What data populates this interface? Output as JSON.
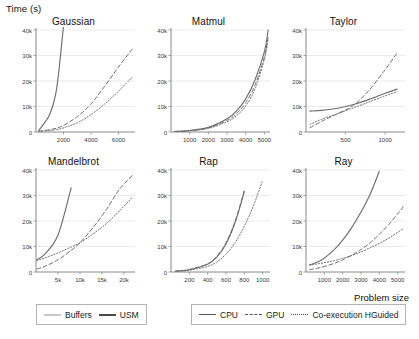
{
  "figure": {
    "ylabel": "Time (s)",
    "xlabel": "Problem size"
  },
  "legend_memory": {
    "items": [
      {
        "label": "Buffers",
        "style": "solid-light",
        "color": "#c9c9c9"
      },
      {
        "label": "USM",
        "style": "solid-dark",
        "color": "#4a4a4a"
      }
    ]
  },
  "legend_device": {
    "items": [
      {
        "label": "CPU",
        "style": "solid",
        "color": "#555555"
      },
      {
        "label": "GPU",
        "style": "dashed",
        "color": "#555555"
      },
      {
        "label": "Co-execution HGuided",
        "style": "dotted",
        "color": "#555555"
      }
    ]
  },
  "chart_data": [
    {
      "type": "line",
      "title": "Gaussian",
      "xlabel": "",
      "ylabel": "Time (s)",
      "xlim": [
        0,
        7200
      ],
      "ylim": [
        0,
        40000
      ],
      "xticks": [
        2000,
        4000,
        6000
      ],
      "xticklabels": [
        "2000",
        "4000",
        "6000"
      ],
      "yticks": [
        0,
        10000,
        20000,
        30000,
        40000
      ],
      "yticklabels": [
        "0",
        "10k",
        "20k",
        "30k",
        "40k"
      ],
      "grid": true,
      "x": [
        200,
        1000,
        1500,
        2000,
        3000,
        4000,
        5000,
        6000,
        7000
      ],
      "series": [
        {
          "name": "CPU",
          "style": "solid",
          "values": [
            600,
            7000,
            17000,
            41500,
            null,
            null,
            null,
            null,
            null
          ]
        },
        {
          "name": "GPU",
          "style": "dashed",
          "values": [
            300,
            900,
            1500,
            2600,
            6000,
            11000,
            18000,
            25500,
            32500
          ]
        },
        {
          "name": "Co-execution HGuided",
          "style": "dotted",
          "values": [
            250,
            600,
            1000,
            1600,
            3600,
            6800,
            11000,
            16000,
            21500
          ]
        }
      ]
    },
    {
      "type": "line",
      "title": "Matmul",
      "xlabel": "",
      "ylabel": "Time (s)",
      "xlim": [
        0,
        5300
      ],
      "ylim": [
        0,
        40000
      ],
      "xticks": [
        1000,
        2000,
        3000,
        4000,
        5000
      ],
      "xticklabels": [
        "1000",
        "2000",
        "3000",
        "4000",
        "5000"
      ],
      "yticks": [
        0,
        10000,
        20000,
        30000,
        40000
      ],
      "yticklabels": [
        "0",
        "10k",
        "20k",
        "30k",
        "40k"
      ],
      "grid": true,
      "x": [
        200,
        1000,
        2000,
        3000,
        3500,
        4000,
        4500,
        5000,
        5200
      ],
      "series": [
        {
          "name": "CPU",
          "style": "solid",
          "values": [
            200,
            600,
            1800,
            5200,
            8200,
            13000,
            20500,
            31500,
            40000
          ]
        },
        {
          "name": "GPU",
          "style": "dashed",
          "values": [
            200,
            550,
            1600,
            4600,
            7200,
            11500,
            18500,
            29500,
            37500
          ]
        },
        {
          "name": "Co-execution HGuided",
          "style": "dotted",
          "values": [
            180,
            500,
            1400,
            4000,
            6300,
            10200,
            17000,
            28500,
            36500
          ]
        }
      ]
    },
    {
      "type": "line",
      "title": "Taylor",
      "xlabel": "",
      "ylabel": "Time (s)",
      "xlim": [
        0,
        1250
      ],
      "ylim": [
        0,
        40000
      ],
      "xticks": [
        500,
        1000
      ],
      "xticklabels": [
        "500",
        "1000"
      ],
      "yticks": [
        0,
        10000,
        20000,
        30000,
        40000
      ],
      "yticklabels": [
        "0",
        "10k",
        "20k",
        "30k",
        "40k"
      ],
      "grid": true,
      "x": [
        50,
        200,
        400,
        600,
        800,
        1000,
        1150
      ],
      "series": [
        {
          "name": "CPU",
          "style": "solid",
          "values": [
            8200,
            8500,
            9300,
            10800,
            12800,
            15200,
            16800
          ]
        },
        {
          "name": "GPU",
          "style": "dashed",
          "values": [
            1700,
            4200,
            7200,
            10500,
            16500,
            24500,
            31000
          ]
        },
        {
          "name": "Co-execution HGuided",
          "style": "dotted",
          "values": [
            3000,
            5000,
            7200,
            9500,
            11800,
            14200,
            15800
          ]
        }
      ]
    },
    {
      "type": "line",
      "title": "Mandelbrot",
      "xlabel": "",
      "ylabel": "Time (s)",
      "xlim": [
        0,
        22500
      ],
      "ylim": [
        0,
        40000
      ],
      "xticks": [
        5000,
        10000,
        15000,
        20000
      ],
      "xticklabels": [
        "5k",
        "10k",
        "15k",
        "20k"
      ],
      "yticks": [
        0,
        10000,
        20000,
        30000,
        40000
      ],
      "yticklabels": [
        "0",
        "10k",
        "20k",
        "30k",
        "40k"
      ],
      "grid": true,
      "x": [
        200,
        2000,
        5000,
        8000,
        10000,
        13000,
        16000,
        19000,
        22000
      ],
      "series": [
        {
          "name": "CPU",
          "style": "solid",
          "values": [
            4800,
            7000,
            14500,
            33000,
            null,
            null,
            null,
            null,
            null
          ]
        },
        {
          "name": "GPU",
          "style": "dashed",
          "values": [
            1200,
            2200,
            4800,
            8500,
            11500,
            17500,
            24500,
            32500,
            38000
          ]
        },
        {
          "name": "Co-execution HGuided",
          "style": "dotted",
          "values": [
            4500,
            5500,
            7500,
            9800,
            11500,
            15000,
            19000,
            24000,
            29500
          ]
        }
      ]
    },
    {
      "type": "line",
      "title": "Rap",
      "xlabel": "",
      "ylabel": "Time (s)",
      "xlim": [
        0,
        1080
      ],
      "ylim": [
        0,
        40000
      ],
      "xticks": [
        200,
        400,
        600,
        800,
        1000
      ],
      "xticklabels": [
        "200",
        "400",
        "600",
        "800",
        "1000"
      ],
      "yticks": [
        0,
        10000,
        20000,
        30000,
        40000
      ],
      "yticklabels": [
        "0",
        "10k",
        "20k",
        "30k",
        "40k"
      ],
      "grid": true,
      "x": [
        50,
        200,
        400,
        500,
        600,
        700,
        800,
        900,
        1000
      ],
      "series": [
        {
          "name": "CPU",
          "style": "solid",
          "values": [
            300,
            900,
            3000,
            5800,
            11000,
            19500,
            31500,
            null,
            null
          ]
        },
        {
          "name": "GPU",
          "style": "dashed",
          "values": [
            350,
            1000,
            3200,
            6200,
            11500,
            20000,
            32000,
            null,
            null
          ]
        },
        {
          "name": "Co-execution HGuided",
          "style": "dotted",
          "values": [
            250,
            700,
            2200,
            4000,
            7000,
            11500,
            18000,
            26000,
            36000
          ]
        }
      ]
    },
    {
      "type": "line",
      "title": "Ray",
      "xlabel": "Problem size",
      "ylabel": "Time (s)",
      "xlim": [
        0,
        5400
      ],
      "ylim": [
        0,
        40000
      ],
      "xticks": [
        1000,
        2000,
        3000,
        4000,
        5000
      ],
      "xticklabels": [
        "1000",
        "2000",
        "3000",
        "4000",
        "5000"
      ],
      "yticks": [
        0,
        10000,
        20000,
        30000,
        40000
      ],
      "yticklabels": [
        "0",
        "10k",
        "20k",
        "30k",
        "40k"
      ],
      "grid": true,
      "x": [
        200,
        800,
        1500,
        2000,
        2500,
        3000,
        3500,
        4000,
        4500,
        5000,
        5300
      ],
      "series": [
        {
          "name": "CPU",
          "style": "solid",
          "values": [
            2800,
            4500,
            8500,
            12500,
            17500,
            23500,
            30500,
            39500,
            null,
            null,
            null
          ]
        },
        {
          "name": "GPU",
          "style": "dashed",
          "values": [
            900,
            1800,
            3300,
            4800,
            6600,
            8800,
            11500,
            14800,
            18500,
            22800,
            25500
          ]
        },
        {
          "name": "Co-execution HGuided",
          "style": "dotted",
          "values": [
            2700,
            3400,
            4400,
            5400,
            6500,
            7900,
            9500,
            11200,
            13200,
            15500,
            17000
          ]
        }
      ]
    }
  ]
}
